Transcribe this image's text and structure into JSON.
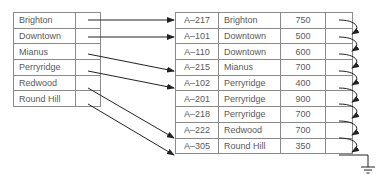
{
  "diagram": {
    "type": "dense index pointing into sequential file",
    "index": {
      "entries": [
        {
          "key": "Brighton",
          "points_to_row": 0
        },
        {
          "key": "Downtown",
          "points_to_row": 1
        },
        {
          "key": "Mianus",
          "points_to_row": 3
        },
        {
          "key": "Perryridge",
          "points_to_row": 4
        },
        {
          "key": "Redwood",
          "points_to_row": 7
        },
        {
          "key": "Round Hill",
          "points_to_row": 8
        }
      ]
    },
    "file": {
      "records": [
        {
          "account": "A–217",
          "branch": "Brighton",
          "balance": "750"
        },
        {
          "account": "A–101",
          "branch": "Downtown",
          "balance": "500"
        },
        {
          "account": "A–110",
          "branch": "Downtown",
          "balance": "600"
        },
        {
          "account": "A–215",
          "branch": "Mianus",
          "balance": "700"
        },
        {
          "account": "A–102",
          "branch": "Perryridge",
          "balance": "400"
        },
        {
          "account": "A–201",
          "branch": "Perryridge",
          "balance": "900"
        },
        {
          "account": "A–218",
          "branch": "Perryridge",
          "balance": "700"
        },
        {
          "account": "A–222",
          "branch": "Redwood",
          "balance": "700"
        },
        {
          "account": "A–305",
          "branch": "Round Hill",
          "balance": "350"
        }
      ],
      "last_pointer": "null (ground symbol)"
    },
    "colors": {
      "border": "#8a8a8a",
      "text": "#5a5a5a",
      "arrow": "#222222"
    }
  }
}
